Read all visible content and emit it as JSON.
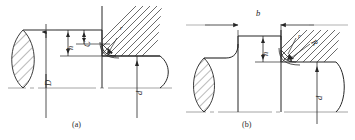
{
  "figure": {
    "kind": "engineering-drawing",
    "top_partial_text": "",
    "stroke_color": "#262626",
    "centerline_color": "#8a8a8a",
    "hatch_color": "#3a3a3a",
    "background": "#ffffff"
  },
  "captions": [
    {
      "id": "a",
      "text": "(a)"
    },
    {
      "id": "b",
      "text": "(b)"
    }
  ],
  "diagram_a": {
    "caption": "(a)",
    "labels": {
      "major_diameter": "D",
      "minor_diameter": "d",
      "shoulder_height": "h",
      "chamfer": "C",
      "fillet_radius": "r"
    }
  },
  "diagram_b": {
    "caption": "(b)",
    "labels": {
      "width": "b",
      "shoulder_height": "h",
      "fillet_radius": "r",
      "grinding_wheel_radius": "R",
      "minor_diameter": "d"
    }
  }
}
